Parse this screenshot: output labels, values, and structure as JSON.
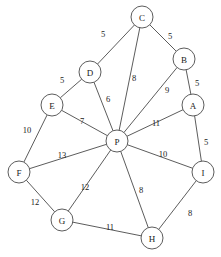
{
  "diagram": {
    "type": "weighted-undirected-graph",
    "title": "",
    "canvas": {
      "width": 221,
      "height": 257
    },
    "style": {
      "node_fill": "#ffffff",
      "node_stroke": "#4a4a4a",
      "edge_stroke": "#4a4a4a",
      "text_color": "#1a1a1a",
      "background": "#ffffff",
      "node_radius": 11
    },
    "nodes": [
      {
        "id": "C",
        "label": "C",
        "x": 142,
        "y": 17
      },
      {
        "id": "B",
        "label": "B",
        "x": 184,
        "y": 59
      },
      {
        "id": "D",
        "label": "D",
        "x": 90,
        "y": 72
      },
      {
        "id": "A",
        "label": "A",
        "x": 193,
        "y": 105
      },
      {
        "id": "E",
        "label": "E",
        "x": 52,
        "y": 105
      },
      {
        "id": "P",
        "label": "P",
        "x": 117,
        "y": 141
      },
      {
        "id": "F",
        "label": "F",
        "x": 19,
        "y": 172
      },
      {
        "id": "I",
        "label": "I",
        "x": 203,
        "y": 172
      },
      {
        "id": "G",
        "label": "G",
        "x": 62,
        "y": 220
      },
      {
        "id": "H",
        "label": "H",
        "x": 152,
        "y": 238
      }
    ],
    "edges": [
      {
        "source": "D",
        "target": "C",
        "weight": "5",
        "label_x": 103,
        "label_y": 34
      },
      {
        "source": "C",
        "target": "B",
        "weight": "5",
        "label_x": 170,
        "label_y": 36
      },
      {
        "source": "E",
        "target": "D",
        "weight": "5",
        "label_x": 62,
        "label_y": 80
      },
      {
        "source": "C",
        "target": "P",
        "weight": "8",
        "label_x": 134,
        "label_y": 78
      },
      {
        "source": "B",
        "target": "A",
        "weight": "5",
        "label_x": 197,
        "label_y": 83
      },
      {
        "source": "B",
        "target": "P",
        "weight": "9",
        "label_x": 167,
        "label_y": 90
      },
      {
        "source": "D",
        "target": "P",
        "weight": "6",
        "label_x": 108,
        "label_y": 99
      },
      {
        "source": "E",
        "target": "F",
        "weight": "10",
        "label_x": 27,
        "label_y": 130
      },
      {
        "source": "E",
        "target": "P",
        "weight": "7",
        "label_x": 82,
        "label_y": 121
      },
      {
        "source": "A",
        "target": "P",
        "weight": "11",
        "label_x": 156,
        "label_y": 123
      },
      {
        "source": "A",
        "target": "I",
        "weight": "5",
        "label_x": 206,
        "label_y": 142
      },
      {
        "source": "F",
        "target": "P",
        "weight": "13",
        "label_x": 62,
        "label_y": 155
      },
      {
        "source": "I",
        "target": "P",
        "weight": "10",
        "label_x": 163,
        "label_y": 154
      },
      {
        "source": "G",
        "target": "P",
        "weight": "12",
        "label_x": 85,
        "label_y": 187
      },
      {
        "source": "H",
        "target": "P",
        "weight": "8",
        "label_x": 141,
        "label_y": 190
      },
      {
        "source": "F",
        "target": "G",
        "weight": "12",
        "label_x": 35,
        "label_y": 202
      },
      {
        "source": "H",
        "target": "I",
        "weight": "8",
        "label_x": 190,
        "label_y": 213
      },
      {
        "source": "G",
        "target": "H",
        "weight": "11",
        "label_x": 110,
        "label_y": 227
      }
    ]
  }
}
